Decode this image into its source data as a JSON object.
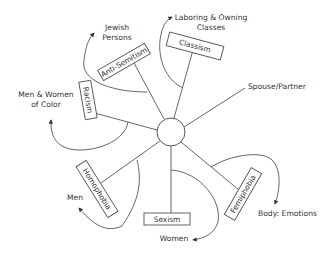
{
  "diagram": {
    "hub": {
      "label": ""
    },
    "spokes": [
      {
        "id": "anti-semitism",
        "box_label": "Anti-Semitism",
        "target_label_lines": [
          "Jewish",
          "Persons"
        ]
      },
      {
        "id": "classism",
        "box_label": "Classism",
        "target_label_lines": [
          "Laboring & Owning",
          "Classes"
        ]
      },
      {
        "id": "spouse-partner",
        "box_label": "",
        "target_label_lines": [
          "Spouse/Partner"
        ]
      },
      {
        "id": "racism",
        "box_label": "Racism",
        "target_label_lines": [
          "Men & Women",
          "of Color"
        ]
      },
      {
        "id": "homophobia",
        "box_label": "Homophobia",
        "target_label_lines": [
          "Men"
        ]
      },
      {
        "id": "sexism",
        "box_label": "Sexism",
        "target_label_lines": [
          "Women"
        ]
      },
      {
        "id": "femiphobia",
        "box_label": "Femiphobia",
        "target_label_lines": [
          "Body: Emotions"
        ]
      }
    ]
  },
  "colors": {
    "stroke": "#555555",
    "text": "#333333",
    "background": "#ffffff"
  }
}
